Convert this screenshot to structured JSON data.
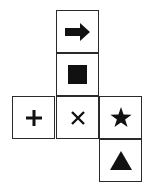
{
  "diagram": {
    "type": "cube-net",
    "cells": [
      {
        "row": 0,
        "col": 1,
        "symbol": "arrow-right",
        "glyph": "➡"
      },
      {
        "row": 1,
        "col": 1,
        "symbol": "filled-square",
        "glyph": "■"
      },
      {
        "row": 2,
        "col": 0,
        "symbol": "plus",
        "glyph": "+"
      },
      {
        "row": 2,
        "col": 1,
        "symbol": "cross",
        "glyph": "×"
      },
      {
        "row": 2,
        "col": 2,
        "symbol": "star",
        "glyph": "★"
      },
      {
        "row": 3,
        "col": 2,
        "symbol": "triangle",
        "glyph": "▲"
      }
    ],
    "colors": {
      "line": "#2a2a2a",
      "fill": "#111111",
      "background": "#ffffff"
    }
  }
}
